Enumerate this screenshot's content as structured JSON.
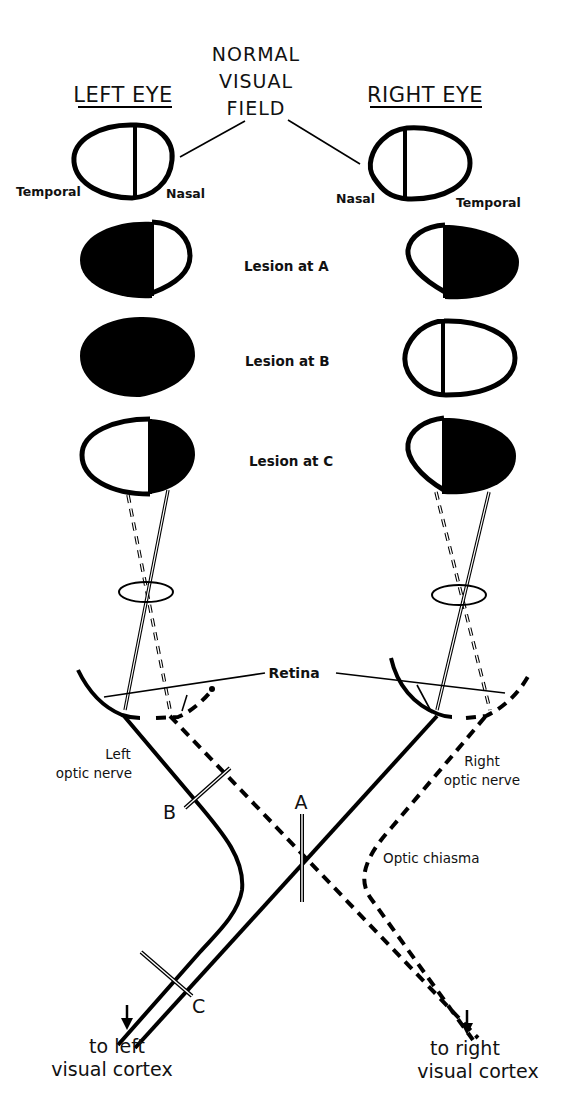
{
  "title": {
    "line1": "NORMAL",
    "line2": "VISUAL",
    "line3": "FIELD"
  },
  "headers": {
    "left_eye": "LEFT EYE",
    "right_eye": "RIGHT EYE"
  },
  "field_labels": {
    "left_temporal": "Temporal",
    "left_nasal": "Nasal",
    "right_nasal": "Nasal",
    "right_temporal": "Temporal"
  },
  "lesions": [
    {
      "label": "Lesion at A",
      "left_field": "temporal-half-blind",
      "right_field": "temporal-half-blind"
    },
    {
      "label": "Lesion at B",
      "left_field": "fully-blind",
      "right_field": "normal"
    },
    {
      "label": "Lesion at C",
      "left_field": "nasal-half-blind",
      "right_field": "temporal-half-blind"
    }
  ],
  "pathway_labels": {
    "retina": "Retina",
    "left_nerve_1": "Left",
    "left_nerve_2": "optic nerve",
    "right_nerve_1": "Right",
    "right_nerve_2": "optic nerve",
    "chiasma": "Optic chiasma",
    "point_a": "A",
    "point_b": "B",
    "point_c": "C"
  },
  "outputs": {
    "left_1": "to left",
    "left_2": "visual cortex",
    "right_1": "to right",
    "right_2": "visual cortex"
  }
}
